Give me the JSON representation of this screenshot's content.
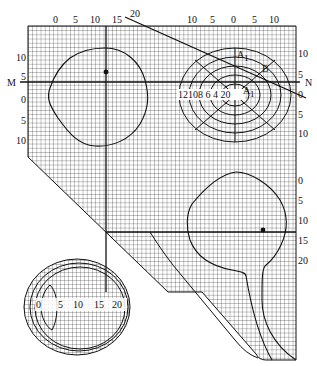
{
  "diagram": {
    "colors": {
      "ink": "#111111",
      "grid": "#333333",
      "background": "#ffffff"
    },
    "top_axis_left": [
      "0",
      "5",
      "10",
      "15"
    ],
    "top_axis_diag_label": "20",
    "top_axis_right": [
      "10",
      "5",
      "0",
      "5",
      "10"
    ],
    "left_axis": [
      "10",
      "5",
      "0",
      "5",
      "10"
    ],
    "left_line_label": "M",
    "right_axis_upper": [
      "10",
      "5",
      "0",
      "5"
    ],
    "right_line_label": "N",
    "right_axis_lower": [
      "0",
      "5",
      "10",
      "15",
      "20"
    ],
    "ring_scale_labels": [
      "12",
      "10",
      "8",
      "6",
      "4",
      "2",
      "0"
    ],
    "ring_scale_text": "12108 6 4 20",
    "point_labels": {
      "a1": "A",
      "a1_sub": "1",
      "b": "B",
      "a": "A",
      "a_sub": "1"
    },
    "eye_scale_labels": [
      "0",
      "5",
      "10",
      "15",
      "20"
    ]
  }
}
